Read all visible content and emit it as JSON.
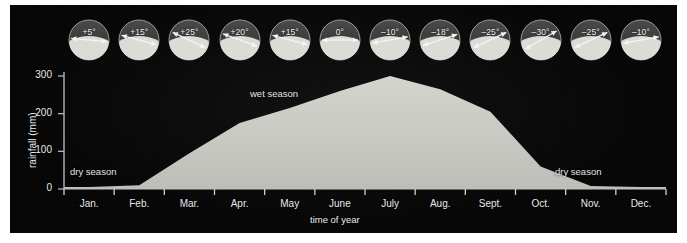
{
  "chart_data": {
    "type": "area",
    "title": "",
    "xlabel": "time of year",
    "ylabel": "rainfall (mm)",
    "categories": [
      "Jan.",
      "Feb.",
      "Mar.",
      "Apr.",
      "May",
      "June",
      "July",
      "Aug.",
      "Sept.",
      "Oct.",
      "Nov.",
      "Dec."
    ],
    "values": [
      5,
      10,
      95,
      175,
      215,
      260,
      300,
      265,
      205,
      60,
      8,
      5
    ],
    "ylim": [
      0,
      330
    ],
    "yticks": [
      0,
      100,
      200,
      300
    ],
    "ytick_labels": [
      "0",
      "100",
      "200",
      "300"
    ],
    "grid": false,
    "legend": "none",
    "series": [
      {
        "name": "rainfall (mm)",
        "values": [
          5,
          10,
          95,
          175,
          215,
          260,
          300,
          265,
          205,
          60,
          8,
          5
        ]
      }
    ],
    "area_color": "#c9cac4",
    "background_color": "#060606",
    "annotations": [
      {
        "text": "dry season",
        "x_month": "Jan.",
        "position": "left"
      },
      {
        "text": "wet season",
        "x_month": "June",
        "position": "upper-middle"
      },
      {
        "text": "dry season",
        "x_month": "Nov.",
        "position": "right"
      }
    ],
    "sun_angles": {
      "note": "Solar altitude diagrams above plot, one per month",
      "values": [
        "+5°",
        "+15°",
        "+25°",
        "+20°",
        "+15°",
        "0°",
        "–10°",
        "–18°",
        "–25°",
        "–30°",
        "–25°",
        "–10°"
      ],
      "degrees": [
        5,
        15,
        25,
        20,
        15,
        0,
        -10,
        -18,
        -25,
        -30,
        -25,
        -10
      ]
    }
  },
  "axes": {
    "y_title": "rainfall (mm)",
    "x_title": "time of year",
    "y_ticks": [
      "300",
      "200",
      "100",
      "0"
    ],
    "months": [
      "Jan.",
      "Feb.",
      "Mar.",
      "Apr.",
      "May",
      "June",
      "July",
      "Aug.",
      "Sept.",
      "Oct.",
      "Nov.",
      "Dec."
    ]
  },
  "seasons": {
    "dry_left": "dry season",
    "wet": "wet season",
    "dry_right": "dry season"
  },
  "sun_dials": [
    {
      "label": "+5°",
      "angle": 5
    },
    {
      "label": "+15°",
      "angle": 15
    },
    {
      "label": "+25°",
      "angle": 25
    },
    {
      "label": "+20°",
      "angle": 20
    },
    {
      "label": "+15°",
      "angle": 15
    },
    {
      "label": "0°",
      "angle": 0
    },
    {
      "label": "–10°",
      "angle": -10
    },
    {
      "label": "–18°",
      "angle": -18
    },
    {
      "label": "–25°",
      "angle": -25
    },
    {
      "label": "–30°",
      "angle": -30
    },
    {
      "label": "–25°",
      "angle": -25
    },
    {
      "label": "–10°",
      "angle": -10
    }
  ],
  "colors": {
    "panel": "#060606",
    "area": "#c9cac4",
    "axis": "#b9b9b9",
    "text": "#ececec",
    "dial_face": "#3a3a3a",
    "dial_base": "#d8d8d2"
  }
}
